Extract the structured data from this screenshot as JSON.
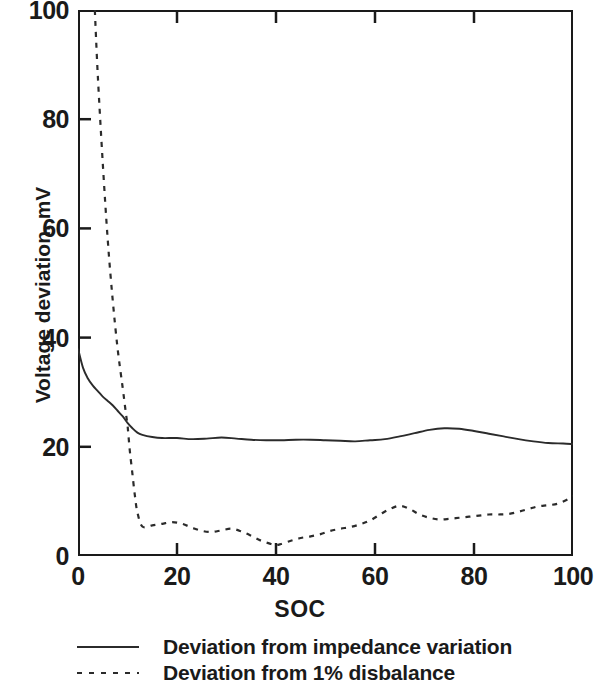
{
  "chart_data": {
    "type": "line",
    "title": "",
    "xlabel": "SOC",
    "ylabel": "Voltage deviation, mV",
    "xlim": [
      0,
      100
    ],
    "ylim": [
      0,
      100
    ],
    "xticks": [
      0,
      20,
      40,
      60,
      80,
      100
    ],
    "yticks": [
      0,
      20,
      40,
      60,
      80,
      100
    ],
    "xtick_labels": [
      "0",
      "20",
      "40",
      "60",
      "80",
      "100"
    ],
    "ytick_labels": [
      "0",
      "20",
      "40",
      "60",
      "80",
      "100"
    ],
    "grid": false,
    "legend_position": "below-axes-left",
    "line_color": "#2b2b2b",
    "frame_color": "#1a1a1a",
    "series": [
      {
        "name": "Deviation from impedance variation",
        "style": "solid",
        "x": [
          0,
          1,
          2,
          3,
          4,
          5,
          6,
          7,
          8,
          9,
          10,
          11,
          12,
          13,
          15,
          17,
          20,
          23,
          26,
          29,
          32,
          35,
          38,
          41,
          44,
          47,
          50,
          53,
          56,
          59,
          62,
          65,
          68,
          71,
          74,
          77,
          80,
          83,
          86,
          89,
          92,
          95,
          98,
          100
        ],
        "y": [
          38.0,
          34.5,
          32.5,
          31.2,
          30.2,
          29.2,
          28.4,
          27.6,
          26.6,
          25.6,
          24.4,
          23.4,
          22.6,
          22.2,
          21.8,
          21.6,
          21.6,
          21.4,
          21.5,
          21.7,
          21.5,
          21.3,
          21.2,
          21.2,
          21.3,
          21.3,
          21.2,
          21.1,
          21.0,
          21.2,
          21.4,
          21.9,
          22.5,
          23.1,
          23.4,
          23.3,
          22.9,
          22.4,
          21.9,
          21.4,
          21.0,
          20.7,
          20.6,
          20.5
        ]
      },
      {
        "name": "Deviation from 1% disbalance",
        "style": "dashed",
        "x": [
          3.4,
          4,
          5,
          6,
          7,
          8,
          9,
          9.7,
          10.0,
          10.2,
          10.5,
          11,
          11.5,
          12,
          13,
          15,
          17,
          19,
          21,
          23,
          25,
          27,
          29,
          31,
          33,
          35,
          37,
          39,
          40,
          41,
          43,
          45,
          47,
          49,
          51,
          53,
          55,
          57,
          59,
          61,
          63,
          65,
          67,
          69,
          71,
          73,
          75,
          77,
          79,
          81,
          83,
          85,
          87,
          89,
          91,
          93,
          95,
          97,
          99,
          100
        ],
        "y": [
          100.0,
          88.0,
          72.0,
          58.0,
          47.0,
          38.0,
          31.0,
          26.0,
          24.0,
          22.0,
          19.0,
          15.0,
          11.0,
          8.0,
          5.4,
          5.6,
          5.9,
          6.2,
          5.9,
          5.2,
          4.6,
          4.4,
          4.7,
          5.0,
          4.5,
          3.7,
          2.8,
          2.2,
          2.0,
          2.2,
          2.8,
          3.3,
          3.6,
          4.0,
          4.6,
          5.0,
          5.3,
          5.8,
          6.5,
          7.6,
          8.6,
          9.2,
          8.6,
          7.6,
          7.0,
          6.7,
          6.8,
          7.0,
          7.2,
          7.4,
          7.6,
          7.6,
          7.7,
          8.1,
          8.6,
          9.1,
          9.3,
          9.6,
          10.4,
          11.0
        ]
      }
    ]
  },
  "axes": {
    "ylabel": "Voltage deviation, mV",
    "xlabel": "SOC"
  },
  "legend": {
    "items": [
      {
        "label": "Deviation from impedance variation",
        "style": "solid"
      },
      {
        "label": "Deviation from 1% disbalance",
        "style": "dashed"
      }
    ]
  }
}
